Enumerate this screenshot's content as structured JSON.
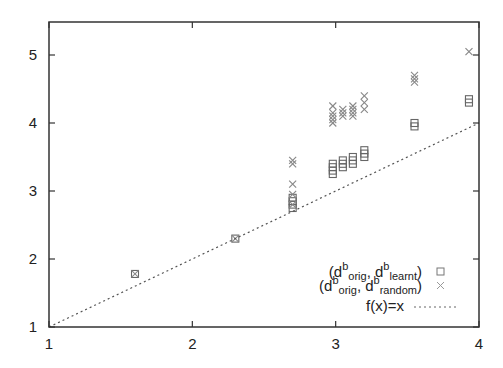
{
  "chart_data": {
    "type": "scatter",
    "title": "",
    "xlabel": "",
    "ylabel": "",
    "xlim": [
      1,
      4
    ],
    "ylim": [
      1,
      5.4
    ],
    "xticks": [
      "1",
      "2",
      "3",
      "4"
    ],
    "yticks": [
      "1",
      "2",
      "3",
      "4",
      "5"
    ],
    "grid": false,
    "legend_position": "bottom-right",
    "series": [
      {
        "name": "(d^b_orig, d^b_learnt)",
        "marker": "square",
        "color": "#666666",
        "points": [
          [
            1.6,
            1.78
          ],
          [
            2.3,
            2.3
          ],
          [
            2.7,
            2.75
          ],
          [
            2.7,
            2.8
          ],
          [
            2.7,
            2.85
          ],
          [
            2.7,
            2.9
          ],
          [
            2.98,
            3.25
          ],
          [
            2.98,
            3.3
          ],
          [
            2.98,
            3.35
          ],
          [
            2.98,
            3.4
          ],
          [
            3.05,
            3.35
          ],
          [
            3.05,
            3.4
          ],
          [
            3.05,
            3.45
          ],
          [
            3.12,
            3.4
          ],
          [
            3.12,
            3.45
          ],
          [
            3.12,
            3.5
          ],
          [
            3.2,
            3.5
          ],
          [
            3.2,
            3.55
          ],
          [
            3.2,
            3.6
          ],
          [
            3.55,
            3.95
          ],
          [
            3.55,
            4.0
          ],
          [
            3.93,
            4.3
          ],
          [
            3.93,
            4.35
          ]
        ]
      },
      {
        "name": "(d^b_orig, d^b_random)",
        "marker": "x",
        "color": "#888888",
        "points": [
          [
            1.6,
            1.78
          ],
          [
            2.3,
            2.3
          ],
          [
            2.7,
            2.8
          ],
          [
            2.7,
            2.95
          ],
          [
            2.7,
            3.1
          ],
          [
            2.7,
            3.4
          ],
          [
            2.7,
            3.45
          ],
          [
            2.98,
            4.0
          ],
          [
            2.98,
            4.05
          ],
          [
            2.98,
            4.1
          ],
          [
            2.98,
            4.15
          ],
          [
            2.98,
            4.25
          ],
          [
            3.05,
            4.1
          ],
          [
            3.05,
            4.15
          ],
          [
            3.05,
            4.2
          ],
          [
            3.12,
            4.1
          ],
          [
            3.12,
            4.15
          ],
          [
            3.12,
            4.2
          ],
          [
            3.12,
            4.25
          ],
          [
            3.2,
            4.2
          ],
          [
            3.2,
            4.3
          ],
          [
            3.2,
            4.4
          ],
          [
            3.55,
            4.6
          ],
          [
            3.55,
            4.65
          ],
          [
            3.55,
            4.7
          ],
          [
            3.93,
            5.05
          ]
        ]
      },
      {
        "name": "f(x)=x",
        "type": "line",
        "style": "dotted",
        "color": "#555555",
        "points": [
          [
            1,
            1
          ],
          [
            4,
            4
          ]
        ]
      }
    ]
  },
  "legend": {
    "entry1": {
      "open": "(d",
      "sup1": "b",
      "sub1": "orig",
      "mid": ", d",
      "sup2": "b",
      "sub2": "learnt",
      "close": ")"
    },
    "entry2": {
      "open": "(d",
      "sup1": "b",
      "sub1": "orig",
      "mid": ", d",
      "sup2": "b",
      "sub2": "random",
      "close": ")"
    },
    "entry3": {
      "label": "f(x)=x"
    }
  },
  "axes": {
    "x_ticks": [
      "1",
      "2",
      "3",
      "4"
    ],
    "y_ticks": [
      "1",
      "2",
      "3",
      "4",
      "5"
    ]
  }
}
